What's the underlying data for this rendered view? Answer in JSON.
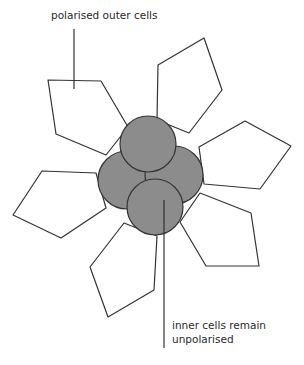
{
  "diagram": {
    "labels": {
      "outer": "polarised outer cells",
      "inner_line1": "inner cells remain",
      "inner_line2": "unpolarised"
    },
    "colors": {
      "outline": "#333333",
      "inner_fill": "#8c8c8c",
      "outer_fill": "#ffffff",
      "background": "#ffffff"
    },
    "outer_cells": [
      {
        "id": "upper-left",
        "points": "48,80 101,81 128,127 106,155 56,134"
      },
      {
        "id": "upper-right",
        "points": "158,65 204,38 222,90 189,133 157,120"
      },
      {
        "id": "right",
        "points": "199,147 245,121 291,146 260,189 204,184"
      },
      {
        "id": "left",
        "points": "42,171 96,173 106,208 61,238 13,215"
      },
      {
        "id": "lower-right",
        "points": "180,222 200,193 251,213 259,266 206,266"
      },
      {
        "id": "lower-left",
        "points": "124,223 157,236 154,290 108,317 90,267"
      }
    ],
    "inner_cells": [
      {
        "id": "left",
        "cx": 127,
        "cy": 180,
        "r": 29
      },
      {
        "id": "right",
        "cx": 174,
        "cy": 175,
        "r": 29
      },
      {
        "id": "top",
        "cx": 148,
        "cy": 144,
        "r": 28
      },
      {
        "id": "bottom",
        "cx": 155,
        "cy": 207,
        "r": 28
      }
    ],
    "leader_lines": [
      {
        "id": "outer-pointer",
        "x1": 74,
        "y1": 29,
        "x2": 74,
        "y2": 89
      },
      {
        "id": "inner-pointer",
        "x1": 164,
        "y1": 200,
        "x2": 164,
        "y2": 348
      }
    ]
  }
}
